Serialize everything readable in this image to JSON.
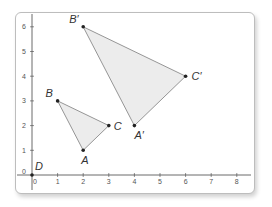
{
  "figure": {
    "x_axis": {
      "ticks": [
        "0",
        "1",
        "2",
        "3",
        "4",
        "5",
        "6",
        "7",
        "8"
      ]
    },
    "y_axis": {
      "ticks": [
        "0",
        "1",
        "2",
        "3",
        "4",
        "5",
        "6"
      ]
    },
    "points": [
      {
        "label": "A",
        "x": 2,
        "y": 1
      },
      {
        "label": "B",
        "x": 1,
        "y": 3
      },
      {
        "label": "C",
        "x": 3,
        "y": 2
      },
      {
        "label": "A'",
        "x": 4,
        "y": 2
      },
      {
        "label": "B'",
        "x": 2,
        "y": 6
      },
      {
        "label": "C'",
        "x": 6,
        "y": 4
      },
      {
        "label": "D",
        "x": 0,
        "y": 0
      }
    ],
    "triangles": [
      {
        "name": "ABC",
        "vertices": [
          "A",
          "B",
          "C"
        ]
      },
      {
        "name": "A'B'C'",
        "vertices": [
          "A'",
          "B'",
          "C'"
        ]
      }
    ],
    "colors": {
      "fill": "#ececec",
      "stroke": "#8a8a8a",
      "axis": "#444444",
      "point": "#222222"
    }
  }
}
